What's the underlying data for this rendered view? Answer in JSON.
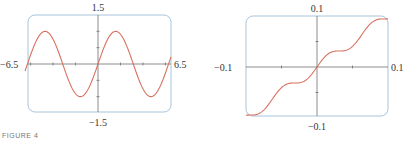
{
  "chart_data": [
    {
      "type": "line",
      "title": "",
      "function": "y = sin(x)",
      "xlim": [
        -6.5,
        6.5
      ],
      "ylim": [
        -1.5,
        1.5
      ],
      "tick_labels": {
        "x_min": "−6.5",
        "x_max": "6.5",
        "y_max": "1.5",
        "y_min": "−1.5"
      },
      "x_ticks": [
        -6,
        -4,
        -2,
        0,
        2,
        4,
        6
      ],
      "y_ticks": [
        -1,
        -0.5,
        0,
        0.5,
        1
      ],
      "grid": false,
      "series": [
        {
          "name": "curve",
          "color": "#d9705f",
          "kind": "sine",
          "freq": 1,
          "amp": 1
        }
      ]
    },
    {
      "type": "line",
      "title": "",
      "function": "y = x + sin(100x)/100",
      "xlim": [
        -0.1,
        0.1
      ],
      "ylim": [
        -0.1,
        0.1
      ],
      "tick_labels": {
        "x_min": "−0.1",
        "x_max": "0.1",
        "y_max": "0.1",
        "y_min": "−0.1"
      },
      "x_ticks": [
        -0.05,
        0,
        0.05
      ],
      "y_ticks": [
        -0.05,
        0,
        0.05
      ],
      "grid": false,
      "series": [
        {
          "name": "curve",
          "color": "#d9705f",
          "kind": "staircase",
          "freq": 100,
          "amp": 0.01
        }
      ]
    }
  ],
  "colors": {
    "frame": "#a8c4dc",
    "axis": "#6f6f6f",
    "curve": "#d9705f"
  },
  "caption": "FIGURE 4"
}
